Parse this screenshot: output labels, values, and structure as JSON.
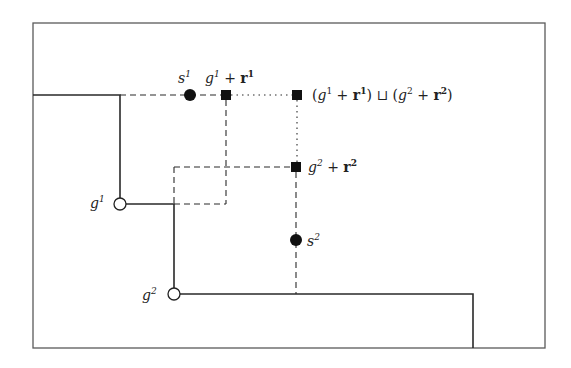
{
  "diagram": {
    "type": "lattice-path-diagram",
    "colors": {
      "background": "#ffffff",
      "stroke": "#2a2a2a",
      "frame": "#555555",
      "point_fill": "#111111"
    },
    "frame": {
      "x": 33,
      "y": 23,
      "width": 512,
      "height": 325
    },
    "boundary_paths": [
      {
        "name": "upper-staircase",
        "style": "solid",
        "points": [
          [
            33,
            95
          ],
          [
            120,
            95
          ],
          [
            120,
            204
          ],
          [
            174,
            204
          ],
          [
            174,
            294
          ],
          [
            473,
            294
          ],
          [
            473,
            348
          ]
        ]
      }
    ],
    "dashed_paths": [
      {
        "name": "s1-horizontal",
        "points": [
          [
            120,
            95
          ],
          [
            226,
            95
          ]
        ]
      },
      {
        "name": "r1-vertical",
        "points": [
          [
            226,
            95
          ],
          [
            226,
            204
          ]
        ]
      },
      {
        "name": "r1-rect-bottom",
        "points": [
          [
            174,
            204
          ],
          [
            226,
            204
          ]
        ]
      },
      {
        "name": "r2-horizontal",
        "points": [
          [
            174,
            167
          ],
          [
            296,
            167
          ]
        ]
      },
      {
        "name": "r2-rect-left",
        "points": [
          [
            174,
            167
          ],
          [
            174,
            204
          ]
        ]
      },
      {
        "name": "s2-vertical",
        "points": [
          [
            296,
            167
          ],
          [
            296,
            294
          ]
        ]
      }
    ],
    "dotted_paths": [
      {
        "name": "join-horizontal",
        "points": [
          [
            226,
            95
          ],
          [
            297,
            95
          ]
        ]
      },
      {
        "name": "join-vertical",
        "points": [
          [
            297,
            95
          ],
          [
            297,
            167
          ]
        ]
      }
    ],
    "points": [
      {
        "id": "s1",
        "kind": "filled-circle",
        "x": 190,
        "y": 95
      },
      {
        "id": "s2",
        "kind": "filled-circle",
        "x": 296,
        "y": 240
      },
      {
        "id": "g1",
        "kind": "open-circle",
        "x": 120,
        "y": 204
      },
      {
        "id": "g2",
        "kind": "open-circle",
        "x": 174,
        "y": 294
      },
      {
        "id": "g1r1",
        "kind": "filled-square",
        "x": 226,
        "y": 95
      },
      {
        "id": "join",
        "kind": "filled-square",
        "x": 297,
        "y": 95
      },
      {
        "id": "g2r2",
        "kind": "filled-square",
        "x": 296,
        "y": 167
      }
    ],
    "labels": {
      "s1": {
        "base": "s",
        "sup": "1"
      },
      "s2": {
        "base": "s",
        "sup": "2"
      },
      "g1": {
        "base": "g",
        "sup": "1"
      },
      "g2": {
        "base": "g",
        "sup": "2"
      },
      "g1r1": {
        "g": "g",
        "g_sup": "1",
        "plus": " + ",
        "r": "r",
        "r_sup": "1"
      },
      "g2r2": {
        "g": "g",
        "g_sup": "2",
        "plus": " + ",
        "r": "r",
        "r_sup": "2"
      },
      "join": {
        "open1": "(",
        "g1": "g",
        "g1_sup": "1",
        "plus1": " + ",
        "r1": "r",
        "r1_sup": "1",
        "close1": ")",
        "op": " ⊔ ",
        "open2": "(",
        "g2": "g",
        "g2_sup": "2",
        "plus2": " + ",
        "r2": "r",
        "r2_sup": "2",
        "close2": ")"
      }
    }
  }
}
